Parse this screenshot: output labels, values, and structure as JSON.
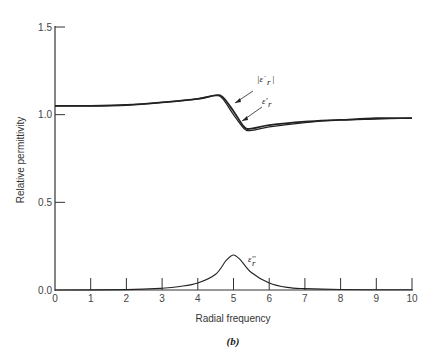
{
  "chart_data": {
    "type": "line",
    "title": "",
    "caption": "(b)",
    "xlabel": "Radial frequency",
    "ylabel": "Relative permittivity",
    "xlim": [
      0,
      10
    ],
    "ylim": [
      0,
      1.5
    ],
    "x_ticks": [
      "0",
      "1",
      "2",
      "3",
      "4",
      "5",
      "6",
      "7",
      "8",
      "9",
      "10"
    ],
    "y_ticks": [
      "0.0",
      "0.5",
      "1.0",
      "1.5"
    ],
    "grid": false,
    "series": [
      {
        "name": "|ε̇r|",
        "x": [
          0,
          1,
          2,
          3,
          4,
          4.5,
          4.7,
          5,
          5.3,
          5.5,
          6,
          7,
          8,
          9,
          10
        ],
        "values": [
          1.05,
          1.05,
          1.055,
          1.07,
          1.09,
          1.11,
          1.1,
          1.02,
          0.93,
          0.92,
          0.94,
          0.96,
          0.97,
          0.98,
          0.98
        ]
      },
      {
        "name": "ε'r",
        "x": [
          0,
          1,
          2,
          3,
          4,
          4.5,
          4.7,
          5,
          5.3,
          5.5,
          6,
          7,
          8,
          9,
          10
        ],
        "values": [
          1.05,
          1.05,
          1.055,
          1.07,
          1.09,
          1.11,
          1.09,
          1.0,
          0.92,
          0.91,
          0.93,
          0.955,
          0.97,
          0.975,
          0.98
        ]
      },
      {
        "name": "ε''r",
        "x": [
          0,
          2,
          3,
          3.5,
          4,
          4.5,
          4.8,
          5,
          5.2,
          5.5,
          6,
          6.5,
          7,
          8,
          10
        ],
        "values": [
          0,
          0.002,
          0.01,
          0.02,
          0.04,
          0.09,
          0.17,
          0.2,
          0.17,
          0.1,
          0.04,
          0.015,
          0.008,
          0.003,
          0.001
        ]
      }
    ],
    "annotations": [
      {
        "label": "|ε̇r|",
        "points_to": "|ε̇r| curve near x≈4.8"
      },
      {
        "label": "ε'r",
        "points_to": "ε'r curve near x≈5.1"
      },
      {
        "label": "ε''r",
        "near": "peak at x=5"
      }
    ]
  }
}
